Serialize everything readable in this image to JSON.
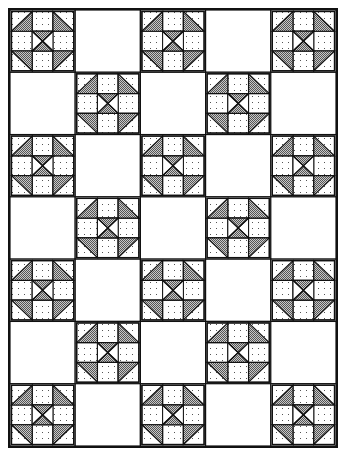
{
  "layout": {
    "rows": 7,
    "cols": 5,
    "arrangement": "checkerboard",
    "pieced_block_cells": "row+col even",
    "plain_block_cells": "row+col odd"
  },
  "block": {
    "name": "pieced-block",
    "grid": "3x3",
    "corners": "half-square triangles, gray half toward block center",
    "edges": "dotted squares",
    "center": "hourglass: gray top and bottom triangles, white left and right"
  },
  "colors": {
    "line": "#111111",
    "gray_fill": "#9a9a9a",
    "dot_fill": "#555555",
    "background": "#ffffff"
  }
}
